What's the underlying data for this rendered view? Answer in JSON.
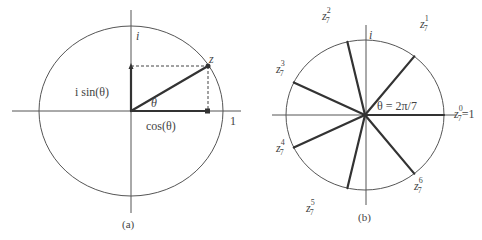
{
  "figure_a": {
    "caption": "(a)",
    "imag_axis_label": "i",
    "real_unit_label": "1",
    "point_label": "z",
    "angle_label": "θ",
    "sin_label": "i sin(θ)",
    "cos_label": "cos(θ)",
    "angle_degrees": 30
  },
  "figure_b": {
    "caption": "(b)",
    "imag_axis_label": "i",
    "angle_annotation": "θ = 2π/7",
    "n": 7,
    "roots": [
      {
        "base": "z",
        "sub": "7",
        "sup": "0",
        "suffix": "=1"
      },
      {
        "base": "z",
        "sub": "7",
        "sup": "1",
        "suffix": ""
      },
      {
        "base": "z",
        "sub": "7",
        "sup": "2",
        "suffix": ""
      },
      {
        "base": "z",
        "sub": "7",
        "sup": "3",
        "suffix": ""
      },
      {
        "base": "z",
        "sub": "7",
        "sup": "4",
        "suffix": ""
      },
      {
        "base": "z",
        "sub": "7",
        "sup": "5",
        "suffix": ""
      },
      {
        "base": "z",
        "sub": "7",
        "sup": "6",
        "suffix": ""
      }
    ]
  }
}
